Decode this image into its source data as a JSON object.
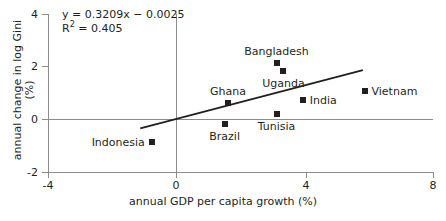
{
  "chart_data": {
    "type": "scatter",
    "title": "",
    "xlabel": "annual GDP per capita growth (%)",
    "ylabel": "annual change in log Gini (%)",
    "xlim": [
      -4,
      8
    ],
    "ylim": [
      -2,
      4
    ],
    "xticks": [
      "-4",
      "0",
      "4",
      "8"
    ],
    "yticks": [
      "4",
      "2",
      "0",
      "-2"
    ],
    "grid": false,
    "legend": "none",
    "annotations": {
      "equation": "y = 0.3209x − 0.0025",
      "r_squared_prefix": "R",
      "r_squared_sup": "2",
      "r_squared_value": " = 0.405"
    },
    "trendline": {
      "slope": 0.3209,
      "intercept": -0.0025,
      "x_start": -1.1,
      "x_end": 5.75
    },
    "points": [
      {
        "name": "Bangladesh",
        "x": 3.1,
        "y": 2.1,
        "label_pos": "above"
      },
      {
        "name": "Uganda",
        "x": 3.3,
        "y": 1.8,
        "label_pos": "below"
      },
      {
        "name": "Ghana",
        "x": 1.6,
        "y": 0.6,
        "label_pos": "above"
      },
      {
        "name": "Vietnam",
        "x": 5.8,
        "y": 1.05,
        "label_pos": "right"
      },
      {
        "name": "India",
        "x": 3.9,
        "y": 0.7,
        "label_pos": "right"
      },
      {
        "name": "Tunisia",
        "x": 3.1,
        "y": 0.2,
        "label_pos": "below"
      },
      {
        "name": "Brazil",
        "x": 1.5,
        "y": -0.2,
        "label_pos": "below"
      },
      {
        "name": "Indonesia",
        "x": -0.75,
        "y": -0.85,
        "label_pos": "left"
      }
    ]
  },
  "colors": {
    "marker": "#231f20",
    "axis": "#8c8c8c",
    "trendline": "#231f20",
    "text": "#231f20",
    "background": "#ffffff"
  }
}
